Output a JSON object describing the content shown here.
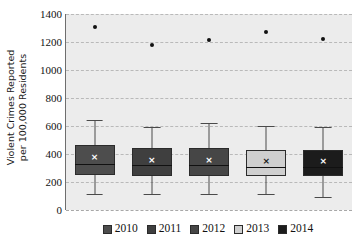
{
  "chart_data": {
    "type": "box",
    "title": "",
    "xlabel": "",
    "ylabel": "Violent Crimes Reported per 100,000 Residents",
    "ylabel_lines": [
      "Violent Crimes Reported",
      "per 100,000 Residents"
    ],
    "ylim": [
      0,
      1400
    ],
    "yticks": [
      1400,
      1200,
      1000,
      800,
      600,
      400,
      200,
      0
    ],
    "ytick_labels": [
      "1400",
      "1200",
      "1000",
      "800",
      "600",
      "400",
      "200",
      "0"
    ],
    "grid": true,
    "grid_style": "dashed",
    "legend_position": "bottom",
    "categories": [
      "2010",
      "2011",
      "2012",
      "2013",
      "2014"
    ],
    "series": [
      {
        "name": "2010",
        "color": "#4d4d4d",
        "min": 115,
        "q1": 250,
        "median": 330,
        "mean": 380,
        "q3": 465,
        "max": 640,
        "outliers": [
          1310
        ]
      },
      {
        "name": "2011",
        "color": "#3f3f3f",
        "min": 115,
        "q1": 245,
        "median": 320,
        "mean": 360,
        "q3": 440,
        "max": 595,
        "outliers": [
          1180
        ]
      },
      {
        "name": "2012",
        "color": "#464646",
        "min": 115,
        "q1": 245,
        "median": 320,
        "mean": 360,
        "q3": 445,
        "max": 620,
        "outliers": [
          1215
        ]
      },
      {
        "name": "2013",
        "color": "#cfcfcf",
        "min": 115,
        "q1": 240,
        "median": 310,
        "mean": 350,
        "q3": 430,
        "max": 600,
        "outliers": [
          1275
        ]
      },
      {
        "name": "2014",
        "color": "#1c1c1c",
        "min": 95,
        "q1": 240,
        "median": 310,
        "mean": 350,
        "q3": 430,
        "max": 590,
        "outliers": [
          1225
        ]
      }
    ],
    "mean_marker": "×",
    "plot_background": "#ececec",
    "gridline_color": "#b9b9b9"
  },
  "legend": {
    "items": [
      {
        "label": "2010",
        "color": "#4d4d4d"
      },
      {
        "label": "2011",
        "color": "#3f3f3f"
      },
      {
        "label": "2012",
        "color": "#464646"
      },
      {
        "label": "2013",
        "color": "#cfcfcf"
      },
      {
        "label": "2014",
        "color": "#1c1c1c"
      }
    ]
  }
}
